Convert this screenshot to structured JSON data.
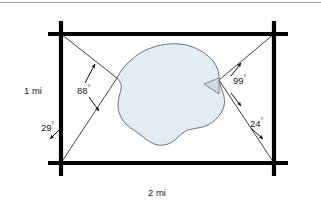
{
  "figure": {
    "background_color": "#ffffff",
    "width": 321,
    "height": 210
  },
  "top_rule": {
    "name": "top-divider",
    "color": "#9a9a9a"
  },
  "frame": {
    "name": "road-frame",
    "color": "#000000",
    "stroke_width": 4.2,
    "left_x": 61,
    "right_x": 274,
    "top_y": 34,
    "bottom_y": 163,
    "overhang": 13,
    "corners": [
      {
        "name": "corner-top-left",
        "x": 61,
        "y": 34
      },
      {
        "name": "corner-top-right",
        "x": 274,
        "y": 34
      },
      {
        "name": "corner-bottom-left",
        "x": 61,
        "y": 163
      },
      {
        "name": "corner-bottom-right",
        "x": 274,
        "y": 163
      }
    ]
  },
  "dimensions": {
    "vertical": {
      "name": "vertical-dimension",
      "text": "1 mi",
      "value": 1,
      "unit": "mi"
    },
    "horizontal": {
      "name": "horizontal-dimension",
      "text": "2 mi",
      "value": 2,
      "unit": "mi"
    }
  },
  "angles": [
    {
      "id": "angle-88",
      "name": "angle-88-label",
      "value": 88,
      "unit": "degrees",
      "text": "88",
      "degree_symbol": "°",
      "vertex": "lake-west-point",
      "description": "Angle at the west point of the lake between the two sight lines from the left corners"
    },
    {
      "id": "angle-29",
      "name": "angle-29-label",
      "value": 29,
      "unit": "degrees",
      "text": "29",
      "degree_symbol": "°",
      "vertex": "corner-bottom-left",
      "description": "Angle at the bottom-left corner between the left road edge and the sight line to the lake west point"
    },
    {
      "id": "angle-99",
      "name": "angle-99-label",
      "value": 99,
      "unit": "degrees",
      "text": "99",
      "degree_symbol": "°",
      "vertex": "lake-east-point",
      "description": "Angle at the east point of the lake between the two sight lines from the right corners"
    },
    {
      "id": "angle-24",
      "name": "angle-24-label",
      "value": 24,
      "unit": "degrees",
      "text": "24",
      "degree_symbol": "°",
      "vertex": "corner-bottom-right",
      "description": "Angle at the bottom-right corner between the right road edge and the sight line to the lake east point"
    }
  ],
  "lake": {
    "name": "lake-shape",
    "fill_color": "#e2ecf4",
    "stroke_color": "#5a6470",
    "stroke_width": 0.9,
    "west_point": {
      "x": 117,
      "y": 78
    },
    "east_point": {
      "x": 219,
      "y": 80
    },
    "outline_path": "M117,78 L122,71 L128,64 L136,57 L146,51 L157,47 L169,45 L180,45 L190,47 L199,51 L207,57 L213,63 L218,69 L219,75 L219,80 L221,88 L223,95 L224,101 L222,107 L218,113 L214,119 L208,124 L200,127 L192,128 L185,130 L180,134 L176,139 L171,143 L165,145 L158,145 L152,142 L147,138 L142,134 L136,131 L130,127 L125,121 L121,114 L119,107 L119,100 L121,94 L122,88 L120,83 Z",
    "inlet": {
      "name": "lake-inlet-triangle",
      "description": "Small hatched triangular inlet on the east shore",
      "fill_color": "#c9d4dd",
      "path": "M219,80 L205,82 L218,93 Z",
      "hatch_color": "#6c7681"
    }
  },
  "sight_lines": {
    "name": "sight-lines",
    "color": "#2a2a2a",
    "stroke_width": 0.9,
    "lines": [
      {
        "name": "sightline-topleft-to-west",
        "x1": 61,
        "y1": 34,
        "x2": 117,
        "y2": 78
      },
      {
        "name": "sightline-bottomleft-to-west",
        "x1": 61,
        "y1": 163,
        "x2": 117,
        "y2": 78
      },
      {
        "name": "sightline-topright-to-east",
        "x1": 274,
        "y1": 34,
        "x2": 219,
        "y2": 80
      },
      {
        "name": "sightline-bottomright-to-east",
        "x1": 274,
        "y1": 163,
        "x2": 219,
        "y2": 80
      }
    ]
  },
  "arrows": {
    "name": "angle-arrows",
    "color": "#1a1a1a",
    "items": [
      {
        "name": "arrow-88-upper",
        "x1": 86,
        "y1": 82,
        "x2": 95,
        "y2": 65
      },
      {
        "name": "arrow-88-lower",
        "x1": 90,
        "y1": 97,
        "x2": 99,
        "y2": 110
      },
      {
        "name": "arrow-29",
        "x1": 60,
        "y1": 129,
        "x2": 51,
        "y2": 139
      },
      {
        "name": "arrow-99-upper",
        "x1": 232,
        "y1": 76,
        "x2": 240,
        "y2": 64
      },
      {
        "name": "arrow-99-lower",
        "x1": 233,
        "y1": 93,
        "x2": 241,
        "y2": 105
      },
      {
        "name": "arrow-24",
        "x1": 252,
        "y1": 129,
        "x2": 262,
        "y2": 139
      }
    ]
  }
}
